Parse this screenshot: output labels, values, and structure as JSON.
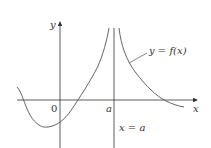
{
  "diagram": {
    "type": "function-graph-vertical-asymptote",
    "axes": {
      "x_label": "x",
      "y_label": "y",
      "origin_label": "0",
      "tick_label_a": "a"
    },
    "asymptote_label": "x = a",
    "curve_label": "y = f(x)",
    "colors": {
      "axis": "#333333",
      "curve": "#555555",
      "text": "#333333",
      "background": "#ffffff"
    }
  }
}
